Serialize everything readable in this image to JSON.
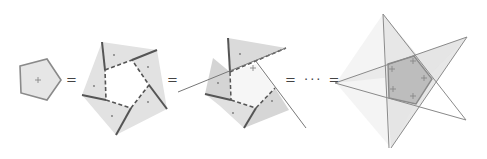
{
  "diagram": {
    "operators": [
      "=",
      "=",
      "= ··· ="
    ],
    "colors": {
      "fill_light": "#e4e4e4",
      "fill_dark": "#bdbdbd",
      "stroke": "#8a8a8a",
      "dashed": "#555555",
      "marker": "#777777"
    },
    "figures": [
      {
        "name": "pentagon",
        "marker": "+"
      },
      {
        "name": "folded-pentagon",
        "markers": 5
      },
      {
        "name": "partially-unfolded-pentagon",
        "markers": 5
      },
      {
        "name": "pentagram-star",
        "markers": 5
      }
    ]
  }
}
